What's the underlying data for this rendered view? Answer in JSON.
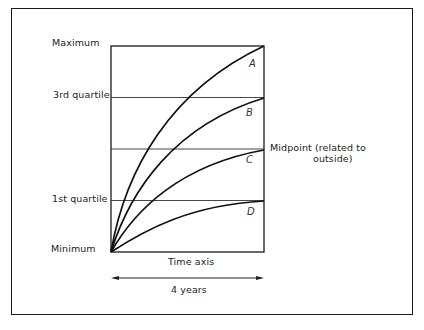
{
  "diagram": {
    "y_levels": {
      "maximum": "Maximum",
      "third_quartile": "3rd quartile",
      "first_quartile": "1st quartile",
      "minimum": "Minimum"
    },
    "midpoint_label_line1": "Midpoint (related to",
    "midpoint_label_line2": "outside)",
    "x_axis_label": "Time axis",
    "duration_label": "4 years",
    "curves": [
      {
        "id": "A",
        "label": "A",
        "end_level": "Maximum"
      },
      {
        "id": "B",
        "label": "B",
        "end_level": "3rd quartile"
      },
      {
        "id": "C",
        "label": "C",
        "end_level": "Midpoint"
      },
      {
        "id": "D",
        "label": "D",
        "end_level": "1st quartile"
      }
    ],
    "colors": {
      "line": "#1a1a1a",
      "background": "#ffffff"
    }
  }
}
